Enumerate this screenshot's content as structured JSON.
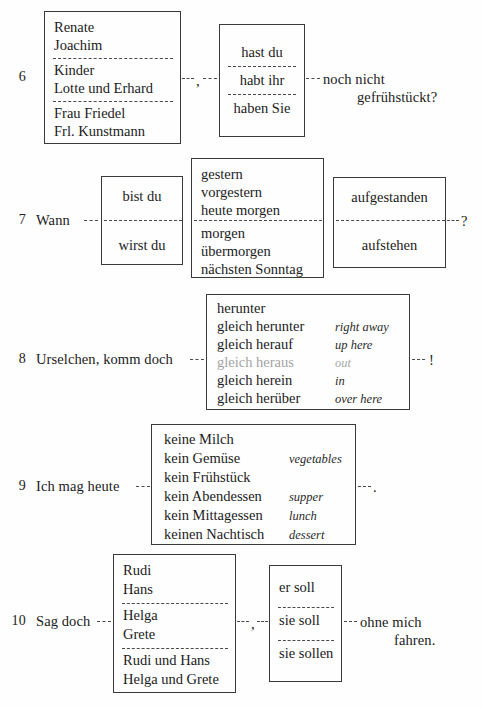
{
  "page": {
    "kind": "textbook-exercise-page",
    "ink_color": "#1b1b1b",
    "rule_color": "#3a3a3a",
    "paper_color": "#fefefe"
  },
  "exercises": [
    {
      "number": "6",
      "stem": "",
      "tail_line1": "noch nicht",
      "tail_line2": "gefrühstückt?",
      "connector_comma": ",",
      "box1": {
        "groups": [
          [
            "Renate",
            "Joachim"
          ],
          [
            "Kinder",
            "Lotte und Erhard"
          ],
          [
            "Frau Friedel",
            "Frl. Kunstmann"
          ]
        ]
      },
      "box2": {
        "groups": [
          [
            "hast du"
          ],
          [
            "habt ihr"
          ],
          [
            "haben Sie"
          ]
        ]
      }
    },
    {
      "number": "7",
      "stem": "Wann",
      "tail_line1": "?",
      "box1": {
        "groups": [
          [
            "bist du"
          ],
          [
            "wirst du"
          ]
        ]
      },
      "box2": {
        "groups": [
          [
            "gestern",
            "vorgestern",
            "heute morgen"
          ],
          [
            "morgen",
            "übermorgen",
            "nächsten Sonntag"
          ]
        ]
      },
      "box3": {
        "groups": [
          [
            "aufgestanden"
          ],
          [
            "aufstehen"
          ]
        ]
      }
    },
    {
      "number": "8",
      "stem": "Urselchen, komm doch",
      "tail_line1": "!",
      "box1": {
        "rows": [
          {
            "de": "herunter",
            "en": ""
          },
          {
            "de": "gleich herunter",
            "en": "right away"
          },
          {
            "de": "gleich herauf",
            "en": "up here"
          },
          {
            "de": "gleich heraus",
            "en": "out",
            "faded": true
          },
          {
            "de": "gleich herein",
            "en": "in"
          },
          {
            "de": "gleich herüber",
            "en": "over here"
          }
        ]
      }
    },
    {
      "number": "9",
      "stem": "Ich mag heute",
      "tail_line1": ".",
      "box1": {
        "rows": [
          {
            "de": "keine Milch",
            "en": ""
          },
          {
            "de": "kein Gemüse",
            "en": "vegetables"
          },
          {
            "de": "kein Frühstück",
            "en": ""
          },
          {
            "de": "kein Abendessen",
            "en": "supper"
          },
          {
            "de": "kein Mittagessen",
            "en": "lunch"
          },
          {
            "de": "keinen Nachtisch",
            "en": "dessert"
          }
        ]
      }
    },
    {
      "number": "10",
      "stem": "Sag doch",
      "tail_line1": "ohne mich",
      "tail_line2": "fahren.",
      "connector_comma": ",",
      "box1": {
        "groups": [
          [
            "Rudi",
            "Hans"
          ],
          [
            "Helga",
            "Grete"
          ],
          [
            "Rudi und Hans",
            "Helga und Grete"
          ]
        ]
      },
      "box2": {
        "groups": [
          [
            "er soll"
          ],
          [
            "sie soll"
          ],
          [
            "sie sollen"
          ]
        ]
      }
    }
  ]
}
